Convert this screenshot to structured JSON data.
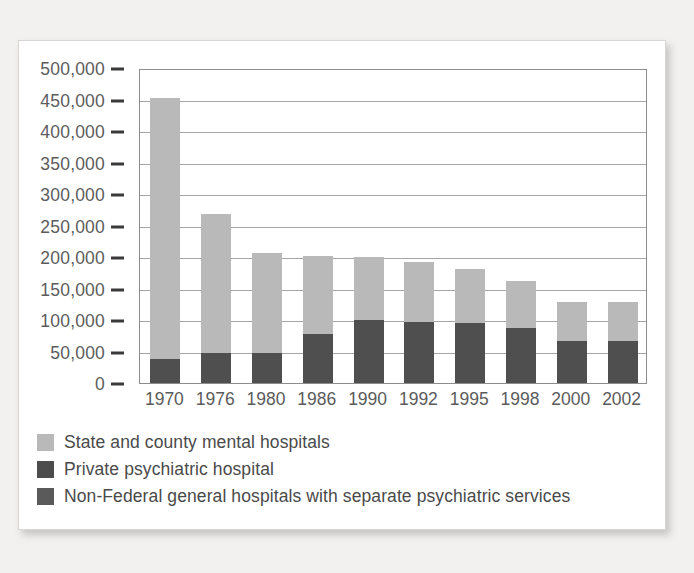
{
  "chart_data": {
    "type": "bar",
    "subtype": "stacked",
    "title": "",
    "xlabel": "",
    "ylabel": "",
    "categories": [
      "1970",
      "1976",
      "1980",
      "1986",
      "1990",
      "1992",
      "1995",
      "1998",
      "2000",
      "2002"
    ],
    "ylim": [
      0,
      500000
    ],
    "ytick_values": [
      0,
      50000,
      100000,
      150000,
      200000,
      250000,
      300000,
      350000,
      400000,
      450000,
      500000
    ],
    "ytick_labels": [
      "0",
      "50,000",
      "100,000",
      "150,000",
      "200,000",
      "250,000",
      "300,000",
      "350,000",
      "400,000",
      "450,000",
      "500,000"
    ],
    "grid": true,
    "legend_position": "below",
    "series": [
      {
        "name": "Non-Federal general hospitals with separate psychiatric services",
        "color": "#4f4f4f",
        "values": [
          38000,
          48000,
          47000,
          78000,
          100000,
          97000,
          96000,
          88000,
          66000,
          66000
        ]
      },
      {
        "name": "State and county mental hospitals",
        "color": "#b9b9b9",
        "values": [
          414000,
          220000,
          159000,
          123000,
          100000,
          95000,
          85000,
          74000,
          63000,
          63000
        ]
      }
    ],
    "totals": [
      452000,
      268000,
      206000,
      201000,
      200000,
      192000,
      181000,
      162000,
      129000,
      129000
    ]
  },
  "legend": {
    "items": [
      {
        "label": "State and county mental hospitals",
        "color": "#b9b9b9"
      },
      {
        "label": "Private psychiatric hospital",
        "color": "#4c4c4c"
      },
      {
        "label": "Non-Federal general hospitals with separate psychiatric services",
        "color": "#5a5a5a"
      }
    ]
  },
  "colors": {
    "background": "#f2f1ef",
    "card": "#ffffff",
    "axis": "#8d8d8d",
    "grid": "#a5a5a5",
    "text": "#5b5b5b",
    "series_light": "#b9b9b9",
    "series_dark": "#4f4f4f"
  }
}
